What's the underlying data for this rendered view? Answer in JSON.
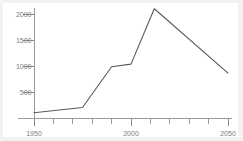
{
  "chart_data": {
    "type": "line",
    "title": "",
    "subtitle": "",
    "xlabel": "",
    "ylabel": "",
    "xlim": [
      1950,
      2050
    ],
    "ylim": [
      0,
      2250
    ],
    "grid": false,
    "legend": null,
    "x_ticks": [
      1950,
      1960,
      1970,
      1980,
      1990,
      2000,
      2010,
      2020,
      2030,
      2040,
      2050
    ],
    "x_tick_labels": [
      "1950",
      "",
      "",
      "",
      "",
      "2000",
      "",
      "",
      "",
      "",
      "2050"
    ],
    "x_major_labels": [
      "1950",
      "2000",
      "2050"
    ],
    "y_ticks": [
      500,
      1000,
      1500,
      2000
    ],
    "y_tick_labels": [
      "500",
      "1000",
      "1500",
      "2000"
    ],
    "series": [
      {
        "name": "series-1",
        "color": "#5a5a5a",
        "x": [
          1950,
          1975,
          1990,
          2000,
          2012,
          2050
        ],
        "values": [
          110,
          210,
          990,
          1040,
          2100,
          870
        ]
      }
    ]
  },
  "axes": {
    "y_axis_name": "y-axis",
    "x_axis_name": "x-axis"
  },
  "colors": {
    "line": "#5a5a5a",
    "axis": "#9a9a9a",
    "tick_label": "#7d7d7d",
    "background": "#ffffff",
    "edge": "#f2f2f2"
  }
}
